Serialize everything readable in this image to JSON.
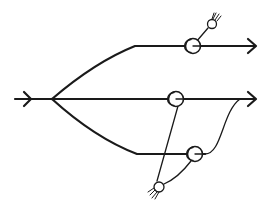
{
  "diagram": {
    "type": "flow-split-schematic",
    "stroke_color": "#1a1a1a",
    "background": "#ffffff",
    "input": {
      "name": "input-flow",
      "from": [
        15,
        99
      ],
      "to": [
        52,
        99
      ],
      "arrow_at": [
        32,
        99
      ]
    },
    "split_point": [
      52,
      99
    ],
    "branches": [
      {
        "name": "top-branch",
        "path": "M52,99 Q95,62 135,46 L255,46",
        "arrow_at": [
          255,
          46
        ]
      },
      {
        "name": "middle-branch",
        "path": "M52,99 L255,99",
        "arrow_at": [
          255,
          99
        ]
      },
      {
        "name": "bottom-branch",
        "path": "M52,99 Q95,138 137,154 L210,154",
        "merge_path": "M205,154 C222,154 222,112 240,99"
      }
    ],
    "pulleys": [
      {
        "name": "top-pulley",
        "cx": 193,
        "cy": 46
      },
      {
        "name": "middle-pulley",
        "cx": 176,
        "cy": 99
      },
      {
        "name": "bottom-pulley",
        "cx": 195,
        "cy": 154
      }
    ],
    "anchors": [
      {
        "name": "top-anchor",
        "cx": 212,
        "cy": 24,
        "hatch": "up-right"
      },
      {
        "name": "bottom-anchor",
        "cx": 159,
        "cy": 187,
        "hatch": "down-left"
      }
    ],
    "links": [
      {
        "name": "top-anchor-link",
        "path": "M196,42 L208,28"
      },
      {
        "name": "middle-to-anchor-link",
        "path": "M178,106 L157,181"
      },
      {
        "name": "bottom-to-anchor-link",
        "path": "M191,161 Q178,178 164,184"
      }
    ]
  }
}
